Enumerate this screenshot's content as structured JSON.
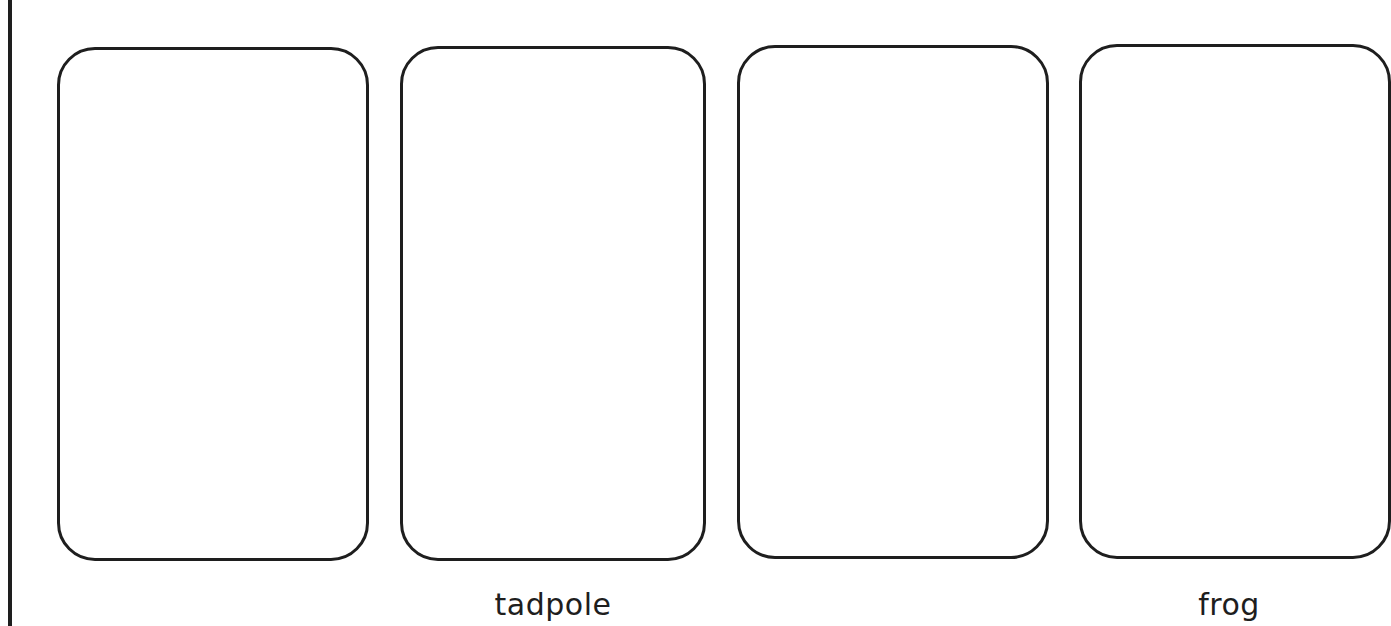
{
  "worksheet": {
    "title": "Frog life cycle sequencing cards",
    "cards": [
      {
        "index": 1,
        "label": ""
      },
      {
        "index": 2,
        "label": "tadpole"
      },
      {
        "index": 3,
        "label": ""
      },
      {
        "index": 4,
        "label": "frog"
      }
    ]
  },
  "colors": {
    "stroke": "#1e1e1e",
    "background": "#ffffff"
  }
}
